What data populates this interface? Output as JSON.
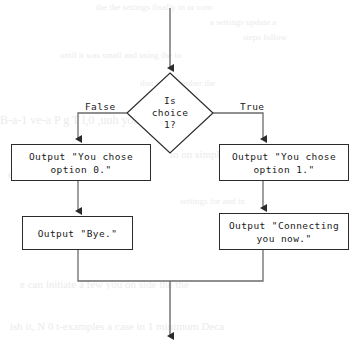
{
  "diagram": {
    "type": "flowchart",
    "colors": {
      "stroke": "#2b2b2b",
      "fill": "#ffffff",
      "text": "#1a1a1a",
      "background": "#ffffff"
    },
    "entry": {
      "name": "entry-arrow",
      "from": [
        170,
        8
      ],
      "to": [
        170,
        72
      ]
    },
    "decision": {
      "name": "decision-is-choice-1",
      "label": "Is\nchoice\n1?",
      "shape": "diamond",
      "center": [
        170,
        113
      ],
      "half_width": 43,
      "half_height": 40
    },
    "branches": [
      {
        "name": "branch-false",
        "label": "False",
        "direction": "left",
        "label_pos": [
          85,
          101
        ]
      },
      {
        "name": "branch-true",
        "label": "True",
        "direction": "right",
        "label_pos": [
          240,
          101
        ]
      }
    ],
    "boxes": [
      {
        "name": "box-output-option-0",
        "label": "Output \"You chose\noption 0.\"",
        "x": 11,
        "y": 144,
        "width": 140,
        "height": 37
      },
      {
        "name": "box-output-option-1",
        "label": "Output \"You chose\noption 1.\"",
        "x": 219,
        "y": 144,
        "width": 130,
        "height": 37
      },
      {
        "name": "box-output-bye",
        "label": "Output \"Bye.\"",
        "x": 22,
        "y": 216,
        "width": 111,
        "height": 34
      },
      {
        "name": "box-output-connecting",
        "label": "Output \"Connecting\nyou now.\"",
        "x": 219,
        "y": 213,
        "width": 130,
        "height": 37
      }
    ],
    "merge": {
      "name": "merge-junction",
      "y": 281,
      "left_x": 78,
      "right_x": 287,
      "exit_x": 170
    },
    "exit": {
      "name": "exit-arrow",
      "from": [
        170,
        281
      ],
      "to": [
        170,
        340
      ]
    },
    "background_bleed": [
      {
        "text": "the the    settings finally  in or com",
        "x": 96,
        "y": 2,
        "size": 9
      },
      {
        "text": "a settings update a",
        "x": 210,
        "y": 17,
        "size": 9
      },
      {
        "text": "steps follow",
        "x": 243,
        "y": 32,
        "size": 9
      },
      {
        "text": "until  it  was  small  and using the  to",
        "x": 60,
        "y": 50,
        "size": 9
      },
      {
        "text": "that  your  number  the",
        "x": 140,
        "y": 78,
        "size": 9
      },
      {
        "text": "B-a-1  ve-a  P  g       T  l,0 ,uuh you",
        "x": 0,
        "y": 113,
        "size": 12
      },
      {
        "text": "in on simply and  T",
        "x": 170,
        "y": 148,
        "size": 11
      },
      {
        "text": "e  tr  the  minimum  with  it  hoping",
        "x": 8,
        "y": 168,
        "size": 11
      },
      {
        "text": "settings for  and in",
        "x": 180,
        "y": 196,
        "size": 9
      },
      {
        "text": "e can initiate a few you on side the the",
        "x": 20,
        "y": 278,
        "size": 11
      },
      {
        "text": "ish it, N 0 t-examples a case in 1 minimum Deca",
        "x": 10,
        "y": 320,
        "size": 11
      }
    ]
  }
}
